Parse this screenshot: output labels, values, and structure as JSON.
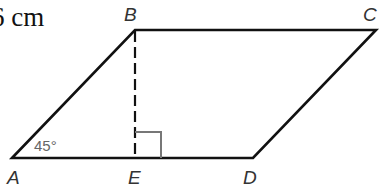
{
  "figure": {
    "type": "parallelogram",
    "measurement_text": "6 cm",
    "angle_label": "45°",
    "vertices": {
      "A": {
        "label": "A",
        "x": 12,
        "y": 158
      },
      "B": {
        "label": "B",
        "x": 135,
        "y": 30
      },
      "C": {
        "label": "C",
        "x": 376,
        "y": 30
      },
      "D": {
        "label": "D",
        "x": 253,
        "y": 158
      },
      "E": {
        "label": "E",
        "x": 135,
        "y": 158
      }
    },
    "height_segment": {
      "from": "B",
      "to": "E",
      "style": "dashed"
    },
    "right_angle_marker": {
      "at": "E",
      "size": 26
    },
    "colors": {
      "stroke": "#111111",
      "marker": "#777777",
      "label": "#333333",
      "angle_text": "#666666"
    }
  }
}
